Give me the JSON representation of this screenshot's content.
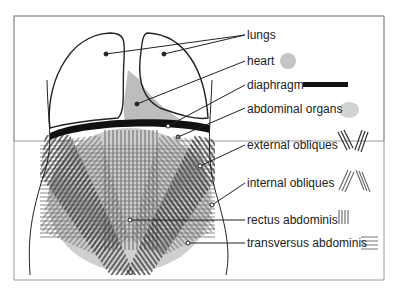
{
  "diagram": {
    "title": "",
    "labels": [
      {
        "id": "lungs",
        "text": "lungs"
      },
      {
        "id": "heart",
        "text": "heart"
      },
      {
        "id": "diaphragm",
        "text": "diaphragm"
      },
      {
        "id": "abdominal_organs",
        "text": "abdominal organs"
      },
      {
        "id": "external_obliques",
        "text": "external obliques"
      },
      {
        "id": "internal_obliques",
        "text": "internal obliques"
      },
      {
        "id": "rectus_abdominis",
        "text": "rectus abdominis"
      },
      {
        "id": "transversus_abdominis",
        "text": "transversus abdominis"
      }
    ],
    "colors": {
      "outline": "#222222",
      "organ_fill": "#c8c8c8",
      "heart_fill": "#b8b8b8",
      "diaphragm": "#111111",
      "muscle_dark": "#333333",
      "muscle_mid": "#777777",
      "frame": "#9a9a9a"
    }
  }
}
